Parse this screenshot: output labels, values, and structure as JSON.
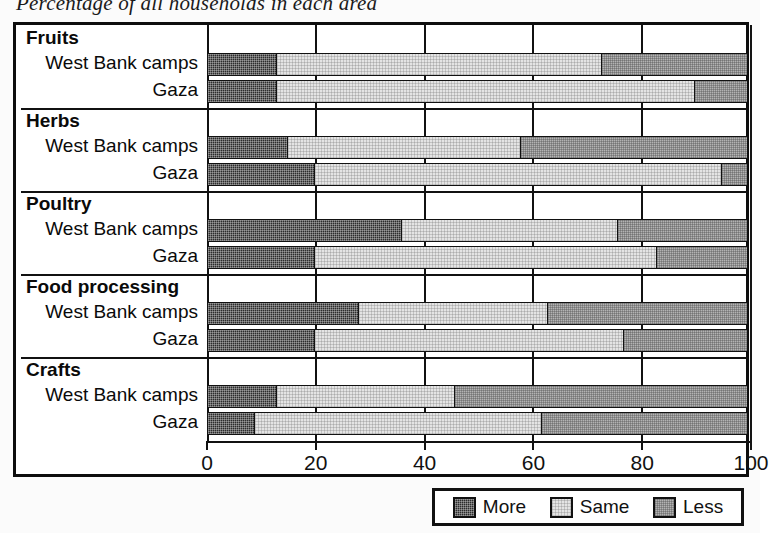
{
  "title": "Percentage of all households in each area",
  "chart_data": {
    "type": "bar",
    "orientation": "horizontal",
    "stacked": true,
    "title": "Percentage of all households in each area",
    "xlabel": "",
    "ylabel": "",
    "xlim": [
      0,
      100
    ],
    "xticks": [
      0,
      20,
      40,
      60,
      80,
      100
    ],
    "grid": true,
    "legend_position": "bottom-right",
    "series": [
      {
        "name": "More",
        "color": "#2c2c2c"
      },
      {
        "name": "Same",
        "color": "#e4e4e4"
      },
      {
        "name": "Less",
        "color": "#b3b3b3"
      }
    ],
    "groups": [
      {
        "name": "Fruits",
        "rows": [
          {
            "label": "West Bank camps",
            "more": 13,
            "same": 60,
            "less": 27
          },
          {
            "label": "Gaza",
            "more": 13,
            "same": 77,
            "less": 10
          }
        ]
      },
      {
        "name": "Herbs",
        "rows": [
          {
            "label": "West Bank camps",
            "more": 15,
            "same": 43,
            "less": 42
          },
          {
            "label": "Gaza",
            "more": 20,
            "same": 75,
            "less": 5
          }
        ]
      },
      {
        "name": "Poultry",
        "rows": [
          {
            "label": "West Bank camps",
            "more": 36,
            "same": 40,
            "less": 24
          },
          {
            "label": "Gaza",
            "more": 20,
            "same": 63,
            "less": 17
          }
        ]
      },
      {
        "name": "Food processing",
        "rows": [
          {
            "label": "West Bank camps",
            "more": 28,
            "same": 35,
            "less": 37
          },
          {
            "label": "Gaza",
            "more": 20,
            "same": 57,
            "less": 23
          }
        ]
      },
      {
        "name": "Crafts",
        "rows": [
          {
            "label": "West Bank camps",
            "more": 13,
            "same": 33,
            "less": 54
          },
          {
            "label": "Gaza",
            "more": 9,
            "same": 53,
            "less": 38
          }
        ]
      }
    ]
  },
  "legend": {
    "items": [
      {
        "label": "More",
        "swatch": "more"
      },
      {
        "label": "Same",
        "swatch": "same"
      },
      {
        "label": "Less",
        "swatch": "less"
      }
    ]
  }
}
